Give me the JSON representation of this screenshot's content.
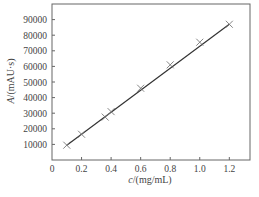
{
  "chart_data": {
    "type": "scatter",
    "title": "",
    "xlabel": "c/(mg/mL)",
    "xlabel_var": "c",
    "xlabel_unit": "/(mg/mL)",
    "ylabel": "A/(mAU·s)",
    "ylabel_var": "A",
    "ylabel_unit": "/(mAU·s)",
    "xlim": [
      0,
      1.34
    ],
    "ylim": [
      0,
      100000
    ],
    "xticks": [
      0,
      0.2,
      0.4,
      0.6,
      0.8,
      1.0,
      1.2
    ],
    "xtick_labels": [
      "0",
      "0.2",
      "0.4",
      "0.6",
      "0.8",
      "1.0",
      "1.2"
    ],
    "yticks": [
      10000,
      20000,
      30000,
      40000,
      50000,
      60000,
      70000,
      80000,
      90000
    ],
    "ytick_labels": [
      "10000",
      "20000",
      "30000",
      "40000",
      "50000",
      "60000",
      "70000",
      "80000",
      "90000"
    ],
    "grid": false,
    "legend": null,
    "series": [
      {
        "name": "data points",
        "marker": "x",
        "x": [
          0.1,
          0.2,
          0.36,
          0.4,
          0.6,
          0.8,
          1.0,
          1.2
        ],
        "y": [
          9500,
          16500,
          27500,
          31000,
          46000,
          61000,
          75500,
          87000
        ]
      },
      {
        "name": "linear fit",
        "style": "line",
        "x": [
          0.1,
          1.2
        ],
        "y": [
          9500,
          87000
        ]
      }
    ]
  }
}
